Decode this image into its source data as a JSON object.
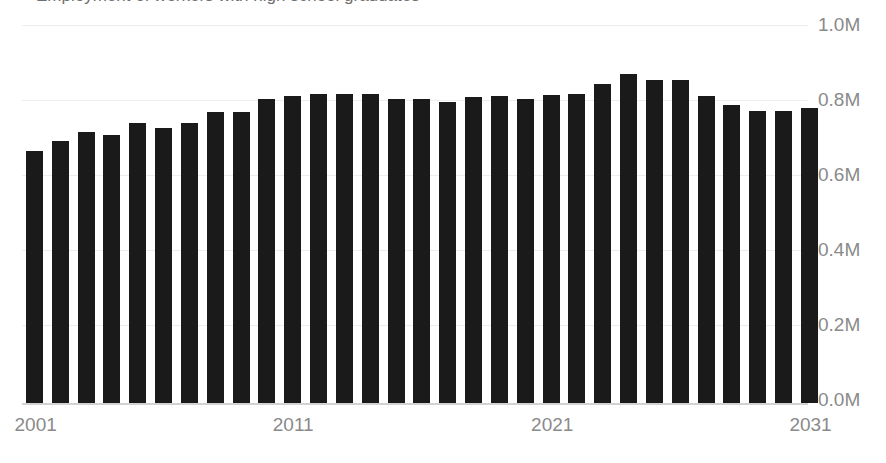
{
  "chart_data": {
    "type": "bar",
    "title": "Employment of workers with high school graduates",
    "xlabel": "",
    "ylabel": "",
    "ylim": [
      0,
      1.0
    ],
    "grid": true,
    "legend": null,
    "y_tick_labels": [
      "1.0M",
      "0.8M",
      "0.6M",
      "0.4M",
      "0.2M",
      "0.0M"
    ],
    "y_tick_values": [
      1.0,
      0.8,
      0.6,
      0.4,
      0.2,
      0.0
    ],
    "y_axis_position": "right",
    "x_tick_labels": [
      "2001",
      "2011",
      "2021",
      "2031"
    ],
    "x_tick_categories": [
      "2001",
      "2011",
      "2021",
      "2031"
    ],
    "bar_color": "#1a1a1a",
    "value_unit": "M",
    "categories": [
      "2001",
      "2002",
      "2003",
      "2004",
      "2005",
      "2006",
      "2007",
      "2008",
      "2009",
      "2010",
      "2011",
      "2012",
      "2013",
      "2014",
      "2015",
      "2016",
      "2017",
      "2018",
      "2019",
      "2020",
      "2021",
      "2022",
      "2023",
      "2024",
      "2025",
      "2026",
      "2027",
      "2028",
      "2029",
      "2030",
      "2031"
    ],
    "values": [
      0.672,
      0.7,
      0.722,
      0.715,
      0.748,
      0.733,
      0.748,
      0.775,
      0.775,
      0.812,
      0.818,
      0.824,
      0.824,
      0.824,
      0.812,
      0.81,
      0.803,
      0.815,
      0.818,
      0.81,
      0.821,
      0.824,
      0.85,
      0.878,
      0.862,
      0.862,
      0.818,
      0.794,
      0.78,
      0.78,
      0.786
    ]
  }
}
